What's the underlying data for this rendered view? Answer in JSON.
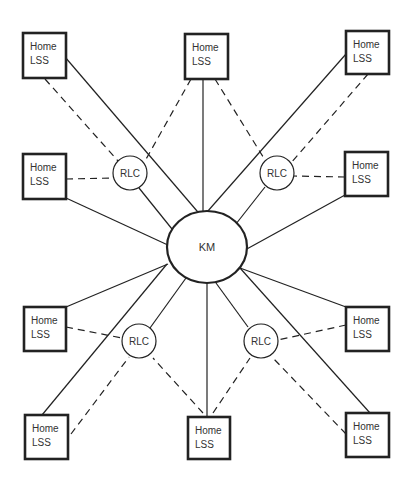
{
  "diagram": {
    "center_node": {
      "id": "KM",
      "label": "KM",
      "cx": 207,
      "cy": 247,
      "rx": 40,
      "ry": 36
    },
    "relay_nodes": [
      {
        "id": "rlc-tl",
        "label": "RLC",
        "cx": 130,
        "cy": 173,
        "r": 17
      },
      {
        "id": "rlc-tr",
        "label": "RLC",
        "cx": 277,
        "cy": 173,
        "r": 17
      },
      {
        "id": "rlc-bl",
        "label": "RLC",
        "cx": 139,
        "cy": 341,
        "r": 17
      },
      {
        "id": "rlc-br",
        "label": "RLC",
        "cx": 261,
        "cy": 341,
        "r": 17
      }
    ],
    "home_nodes": [
      {
        "id": "lss-tl",
        "line1": "Home",
        "line2": "LSS",
        "x": 23,
        "y": 33,
        "w": 43,
        "h": 45
      },
      {
        "id": "lss-tc",
        "line1": "Home",
        "line2": "LSS",
        "x": 185,
        "y": 34,
        "w": 43,
        "h": 45
      },
      {
        "id": "lss-tr",
        "line1": "Home",
        "line2": "LSS",
        "x": 346,
        "y": 31,
        "w": 43,
        "h": 43
      },
      {
        "id": "lss-ml",
        "line1": "Home",
        "line2": "LSS",
        "x": 23,
        "y": 154,
        "w": 43,
        "h": 45
      },
      {
        "id": "lss-mr",
        "line1": "Home",
        "line2": "LSS",
        "x": 345,
        "y": 152,
        "w": 43,
        "h": 44
      },
      {
        "id": "lss-ll",
        "line1": "Home",
        "line2": "LSS",
        "x": 24,
        "y": 307,
        "w": 42,
        "h": 44
      },
      {
        "id": "lss-lr",
        "line1": "Home",
        "line2": "LSS",
        "x": 346,
        "y": 307,
        "w": 43,
        "h": 44
      },
      {
        "id": "lss-bl",
        "line1": "Home",
        "line2": "LSS",
        "x": 25,
        "y": 415,
        "w": 43,
        "h": 44
      },
      {
        "id": "lss-bc",
        "line1": "Home",
        "line2": "LSS",
        "x": 188,
        "y": 417,
        "w": 42,
        "h": 42
      },
      {
        "id": "lss-br",
        "line1": "Home",
        "line2": "LSS",
        "x": 346,
        "y": 413,
        "w": 43,
        "h": 44
      }
    ],
    "solid_links": [
      {
        "from": "lss-tl",
        "x1": 65,
        "y1": 57,
        "x2": 203,
        "y2": 218
      },
      {
        "from": "lss-tc",
        "x1": 203,
        "y1": 79,
        "x2": 203,
        "y2": 218
      },
      {
        "from": "lss-tr",
        "x1": 346,
        "y1": 54,
        "x2": 200,
        "y2": 220
      },
      {
        "from": "lss-ml",
        "x1": 66,
        "y1": 198,
        "x2": 170,
        "y2": 246
      },
      {
        "from": "lss-mr",
        "x1": 345,
        "y1": 195,
        "x2": 245,
        "y2": 250
      },
      {
        "from": "lss-ll",
        "x1": 66,
        "y1": 307,
        "x2": 168,
        "y2": 264
      },
      {
        "from": "lss-lr",
        "x1": 346,
        "y1": 307,
        "x2": 240,
        "y2": 268
      },
      {
        "from": "lss-bl",
        "x1": 42,
        "y1": 415,
        "x2": 167,
        "y2": 264
      },
      {
        "from": "lss-bc",
        "x1": 207,
        "y1": 417,
        "x2": 207,
        "y2": 283
      },
      {
        "from": "lss-br",
        "x1": 370,
        "y1": 413,
        "x2": 240,
        "y2": 268
      },
      {
        "from": "rlc-tl",
        "x1": 139,
        "y1": 188,
        "x2": 172,
        "y2": 229
      },
      {
        "from": "rlc-tr",
        "x1": 265,
        "y1": 187,
        "x2": 232,
        "y2": 229
      },
      {
        "from": "rlc-bl",
        "x1": 150,
        "y1": 328,
        "x2": 186,
        "y2": 278
      },
      {
        "from": "rlc-br",
        "x1": 248,
        "y1": 327,
        "x2": 216,
        "y2": 283
      }
    ],
    "dashed_links": [
      {
        "from": "lss-tl",
        "to": "rlc-tl",
        "x1": 45,
        "y1": 79,
        "x2": 118,
        "y2": 161
      },
      {
        "from": "lss-tc",
        "to": "rlc-tl",
        "x1": 191,
        "y1": 79,
        "x2": 145,
        "y2": 161
      },
      {
        "from": "lss-ml",
        "to": "rlc-tl",
        "x1": 66,
        "y1": 179,
        "x2": 113,
        "y2": 178
      },
      {
        "from": "lss-tc",
        "to": "rlc-tr",
        "x1": 215,
        "y1": 79,
        "x2": 265,
        "y2": 160
      },
      {
        "from": "lss-tr",
        "to": "rlc-tr",
        "x1": 368,
        "y1": 74,
        "x2": 291,
        "y2": 163
      },
      {
        "from": "lss-mr",
        "to": "rlc-tr",
        "x1": 345,
        "y1": 177,
        "x2": 294,
        "y2": 176
      },
      {
        "from": "lss-ll",
        "to": "rlc-bl",
        "x1": 66,
        "y1": 327,
        "x2": 122,
        "y2": 338
      },
      {
        "from": "lss-bl",
        "to": "rlc-bl",
        "x1": 71,
        "y1": 434,
        "x2": 129,
        "y2": 357
      },
      {
        "from": "lss-bc",
        "to": "rlc-bl",
        "x1": 203,
        "y1": 413,
        "x2": 153,
        "y2": 358
      },
      {
        "from": "lss-lr",
        "to": "rlc-br",
        "x1": 346,
        "y1": 325,
        "x2": 278,
        "y2": 340
      },
      {
        "from": "lss-bc",
        "to": "rlc-br",
        "x1": 213,
        "y1": 413,
        "x2": 250,
        "y2": 358
      },
      {
        "from": "lss-br",
        "to": "rlc-br",
        "x1": 346,
        "y1": 434,
        "x2": 272,
        "y2": 357
      }
    ]
  }
}
